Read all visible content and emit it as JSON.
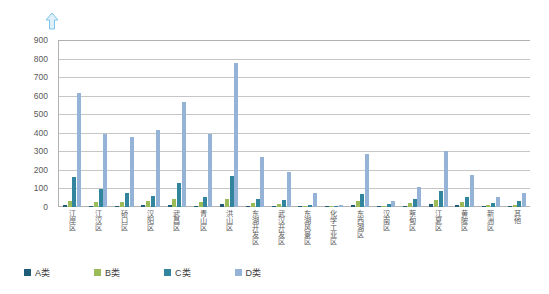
{
  "header": {
    "arrow_icon": "up-arrow-icon"
  },
  "legend": {
    "position": "bottom-left",
    "items": [
      {
        "key": "A",
        "label": "A类",
        "color": "#1f5c77"
      },
      {
        "key": "B",
        "label": "B类",
        "color": "#9bbb59"
      },
      {
        "key": "C",
        "label": "C类",
        "color": "#31859c"
      },
      {
        "key": "D",
        "label": "D类",
        "color": "#95b3d7"
      }
    ]
  },
  "chart_data": {
    "type": "bar",
    "title": "",
    "subtitle": "",
    "xlabel": "",
    "ylabel": "",
    "ylim": [
      0,
      900
    ],
    "ytick_step": 100,
    "yticks": [
      "0",
      "100",
      "200",
      "300",
      "400",
      "500",
      "600",
      "700",
      "800",
      "900"
    ],
    "grid": true,
    "legend_position": "bottom-left",
    "categories": [
      "江岸区",
      "江汉区",
      "硚口区",
      "汉阳区",
      "武昌区",
      "青山区",
      "洪山区",
      "东湖开发区",
      "武汉开发区",
      "东湖风景区",
      "化学工业区",
      "东西湖区",
      "汉南区",
      "蔡甸区",
      "江夏区",
      "黄陂区",
      "新洲区",
      "其他"
    ],
    "series": [
      {
        "name": "A类",
        "color": "#1f5c77",
        "values": [
          12,
          8,
          6,
          10,
          9,
          8,
          14,
          6,
          5,
          3,
          2,
          10,
          3,
          8,
          14,
          9,
          5,
          4
        ]
      },
      {
        "name": "B类",
        "color": "#9bbb59",
        "values": [
          30,
          28,
          26,
          34,
          45,
          25,
          45,
          22,
          18,
          8,
          4,
          30,
          8,
          22,
          38,
          25,
          12,
          10
        ]
      },
      {
        "name": "C类",
        "color": "#31859c",
        "values": [
          160,
          98,
          78,
          60,
          130,
          55,
          165,
          42,
          38,
          12,
          5,
          72,
          15,
          45,
          88,
          52,
          22,
          30
        ]
      },
      {
        "name": "D类",
        "color": "#95b3d7",
        "values": [
          615,
          395,
          380,
          415,
          565,
          395,
          775,
          270,
          190,
          75,
          10,
          285,
          35,
          110,
          300,
          175,
          55,
          78
        ]
      }
    ]
  }
}
